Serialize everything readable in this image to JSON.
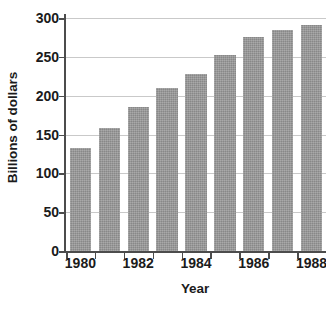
{
  "chart_data": {
    "type": "bar",
    "title": "",
    "xlabel": "Year",
    "ylabel": "Billions of dollars",
    "categories": [
      1980,
      1981,
      1982,
      1983,
      1984,
      1985,
      1986,
      1987,
      1988
    ],
    "values": [
      133,
      158,
      186,
      210,
      228,
      253,
      275,
      284,
      291
    ],
    "series": [
      {
        "name": "Billions of dollars",
        "values": [
          133,
          158,
          186,
          210,
          228,
          253,
          275,
          284,
          291
        ]
      }
    ],
    "ylim": [
      0,
      300
    ],
    "ytick_values": [
      0,
      50,
      100,
      150,
      200,
      250,
      300
    ],
    "ytick_labels": [
      "0",
      "50",
      "100",
      "150",
      "200",
      "250",
      "300"
    ],
    "xtick_labels": [
      "1980",
      "1982",
      "1984",
      "1986",
      "1988"
    ],
    "xtick_categories": [
      1980,
      1982,
      1984,
      1986,
      1988
    ],
    "grid": "horizontal",
    "legend": "none",
    "bar_color": "#949494",
    "axis_color": "#4c4c4c",
    "gridline_color": "#c9c9c9",
    "text_color": "#1b1b1b",
    "background_color": "#ffffff"
  }
}
